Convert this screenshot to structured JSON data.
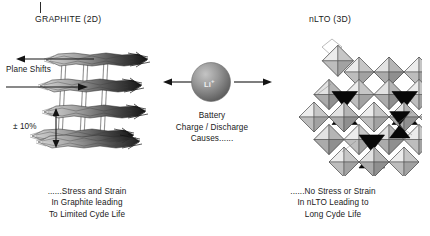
{
  "figure": {
    "background": "#ffffff",
    "ink": "#191919"
  },
  "left_panel": {
    "title": "GRAPHITE (2D)",
    "plane_shift_label": "Plane Shifts",
    "expansion_label": "± 10%",
    "caption_lines": [
      "......Stress and Strain",
      "In Graphite leading",
      "To Limited Cyde Life"
    ],
    "structure": {
      "name": "graphite-layer-stack",
      "layer_count": 4,
      "column_count": 4,
      "shading": [
        "#cfcfcf",
        "#9a9a9a",
        "#5a5a5a",
        "#1f1f1f"
      ]
    }
  },
  "center_panel": {
    "ion_label": "Li",
    "ion_charge": "+",
    "text_lines": [
      "Battery",
      "Charge / Discharge",
      "Causes......"
    ],
    "arrow_left": "arrow-left",
    "arrow_right": "arrow-right",
    "sphere_color": "#8a8a8a"
  },
  "right_panel": {
    "title": "nLTO (3D)",
    "caption_lines": [
      "......No Stress or Strain",
      "In nLTO Leading to",
      "Long Cyde Life"
    ],
    "structure": {
      "name": "nlto-polyhedra-cluster",
      "octahedron_fill_light": "#d8d8d8",
      "octahedron_fill_mid": "#b4b4b4",
      "octahedron_fill_dark": "#8e8e8e",
      "tetrahedron_fill": "#0d0d0d"
    }
  }
}
